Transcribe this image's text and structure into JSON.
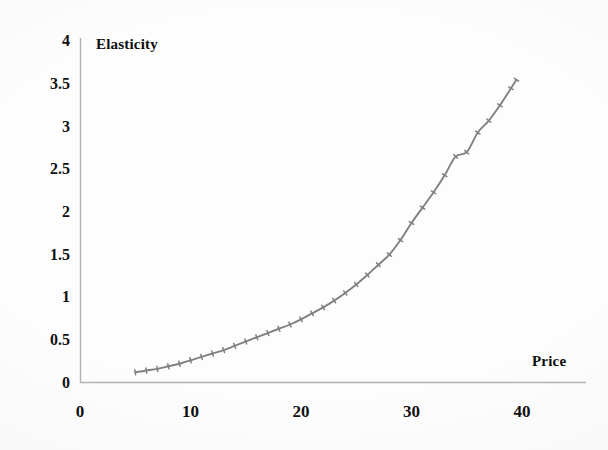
{
  "chart_data": {
    "type": "line",
    "title": "",
    "xlabel": "Price",
    "ylabel": "Elasticity",
    "xlim": [
      0,
      45
    ],
    "ylim": [
      0,
      4
    ],
    "xticks": [
      0,
      10,
      20,
      30,
      40
    ],
    "xtick_labels": [
      "0",
      "10",
      "20",
      "30",
      "40"
    ],
    "yticks": [
      0,
      0.5,
      1,
      1.5,
      2,
      2.5,
      3,
      3.5,
      4
    ],
    "ytick_labels": [
      "0",
      "0.5",
      "1",
      "1.5",
      "2",
      "2.5",
      "3",
      "3.5",
      "4"
    ],
    "grid": false,
    "legend": false,
    "series": [
      {
        "name": "Elasticity",
        "color": "#808080",
        "marker": "cross",
        "x": [
          5,
          6,
          7,
          8,
          9,
          10,
          11,
          12,
          13,
          14,
          15,
          16,
          17,
          18,
          19,
          20,
          21,
          22,
          23,
          24,
          25,
          26,
          27,
          28,
          29,
          30,
          31,
          32,
          33,
          34,
          35,
          36,
          37,
          38,
          39,
          39.5
        ],
        "values": [
          0.12,
          0.14,
          0.16,
          0.19,
          0.22,
          0.26,
          0.3,
          0.34,
          0.38,
          0.43,
          0.48,
          0.53,
          0.58,
          0.63,
          0.68,
          0.74,
          0.81,
          0.88,
          0.96,
          1.05,
          1.15,
          1.26,
          1.38,
          1.5,
          1.67,
          1.87,
          2.05,
          2.23,
          2.43,
          2.65,
          2.7,
          2.93,
          3.07,
          3.25,
          3.45,
          3.55
        ]
      }
    ]
  },
  "axes": {
    "axis_color": "#b0b0b0",
    "y_axis_title": "Elasticity",
    "x_axis_title": "Price"
  }
}
